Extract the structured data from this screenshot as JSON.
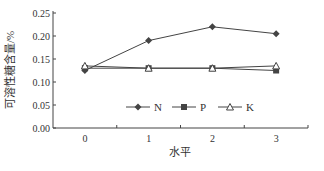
{
  "chart_data": {
    "type": "line",
    "title": "",
    "xlabel": "水平",
    "ylabel": "可溶性糖含量/%",
    "categories": [
      "0",
      "1",
      "2",
      "3"
    ],
    "yticks": [
      "0.00",
      "0.05",
      "0.10",
      "0.15",
      "0.20",
      "0.25"
    ],
    "ylim": [
      0,
      0.25
    ],
    "grid": false,
    "legend_position": "inside-bottom-center",
    "series": [
      {
        "name": "N",
        "marker": "diamond-filled",
        "values": [
          0.125,
          0.19,
          0.22,
          0.205
        ]
      },
      {
        "name": "P",
        "marker": "square-filled",
        "values": [
          0.13,
          0.13,
          0.13,
          0.125
        ]
      },
      {
        "name": "K",
        "marker": "triangle-open",
        "values": [
          0.135,
          0.13,
          0.13,
          0.135
        ]
      }
    ]
  },
  "colors": {
    "line": "#444444",
    "axis": "#444444",
    "text": "#333333"
  }
}
